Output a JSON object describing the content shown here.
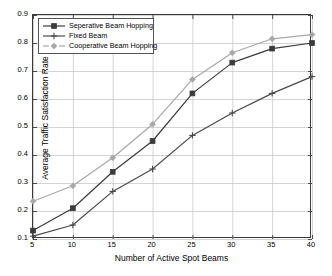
{
  "chart_data": {
    "type": "line",
    "title": "",
    "xlabel": "Number of Active Spot Beams",
    "ylabel": "Average Traffic Satisfaction Rate",
    "x": [
      5,
      10,
      15,
      20,
      25,
      30,
      35,
      40
    ],
    "xlim": [
      5,
      40
    ],
    "ylim": [
      0.1,
      0.9
    ],
    "xticks": [
      "5",
      "10",
      "15",
      "20",
      "25",
      "30",
      "35",
      "40"
    ],
    "yticks": [
      "0.1",
      "0.2",
      "0.3",
      "0.4",
      "0.5",
      "0.6",
      "0.7",
      "0.8",
      "0.9"
    ],
    "grid": true,
    "legend_position": "upper-left",
    "series": [
      {
        "name": "Seperative Beam Hopping",
        "marker": "square",
        "color": "#3b3b3b",
        "values": [
          0.13,
          0.21,
          0.34,
          0.45,
          0.62,
          0.73,
          0.78,
          0.8
        ]
      },
      {
        "name": "Fixed Beam",
        "marker": "plus",
        "color": "#4a4a4a",
        "values": [
          0.11,
          0.15,
          0.27,
          0.35,
          0.47,
          0.55,
          0.62,
          0.68
        ]
      },
      {
        "name": "Cooperative Beam Hopping",
        "marker": "diamond",
        "color": "#a8a8a8",
        "values": [
          0.235,
          0.29,
          0.39,
          0.51,
          0.67,
          0.765,
          0.815,
          0.83
        ]
      }
    ]
  },
  "colors": {
    "axis": "#3a3a3a",
    "grid": "#c9c9c9",
    "background": "#ffffff",
    "legend_border": "#555555"
  }
}
